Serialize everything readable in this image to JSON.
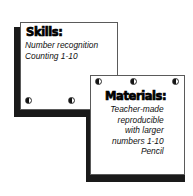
{
  "page": {
    "background_color": "#ffffff",
    "ink_color": "#000000",
    "shadow_color": "#1a1a1a"
  },
  "cards": [
    {
      "id": "skills",
      "title": "Skills:",
      "lines": [
        {
          "text": "Number recognition",
          "indented": false
        },
        {
          "text": "Counting 1-10",
          "indented": false
        }
      ],
      "holes": 2,
      "hole_position": "bottom"
    },
    {
      "id": "materials",
      "title": "Materials:",
      "lines": [
        {
          "text": "Teacher-made",
          "indented": false
        },
        {
          "text": "reproducible",
          "indented": true
        },
        {
          "text": "with larger",
          "indented": true
        },
        {
          "text": "numbers 1-10",
          "indented": true
        },
        {
          "text": "Pencil",
          "indented": false
        }
      ],
      "holes": 3,
      "hole_position": "top"
    }
  ]
}
